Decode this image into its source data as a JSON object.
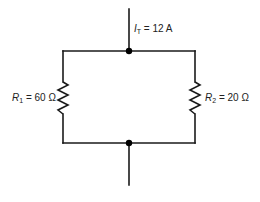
{
  "diagram": {
    "type": "parallel-resistor-circuit",
    "total_current": {
      "symbol": "I",
      "subscript": "T",
      "equals": " = ",
      "value": "12 A"
    },
    "resistors": [
      {
        "id": "R1",
        "symbol": "R",
        "subscript": "1",
        "equals": " = ",
        "value": "60 Ω",
        "side": "left"
      },
      {
        "id": "R2",
        "symbol": "R",
        "subscript": "2",
        "equals": " = ",
        "value": "20 Ω",
        "side": "right"
      }
    ],
    "junctions": [
      "top",
      "bottom"
    ],
    "colors": {
      "wire": "#1a1a1a",
      "junction": "#000000",
      "label": "#222222",
      "background": "#ffffff"
    }
  }
}
